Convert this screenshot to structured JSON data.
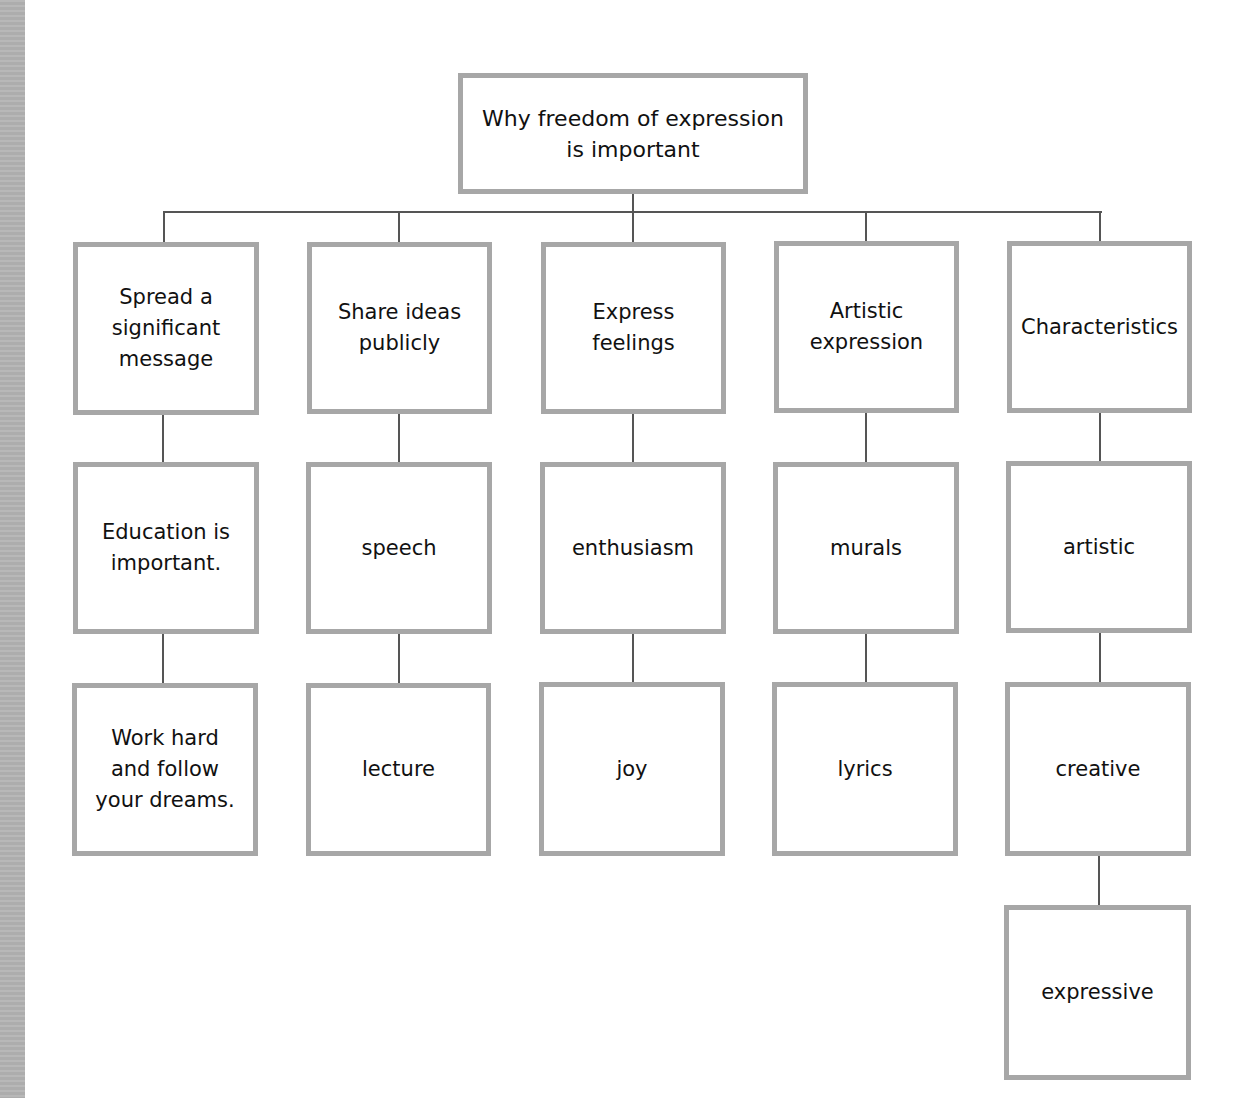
{
  "diagram": {
    "type": "hierarchy-tree",
    "root": {
      "label": "Why freedom of expression\nis important"
    },
    "branches": [
      {
        "label": "Spread a\nsignificant\nmessage",
        "children": [
          {
            "label": "Education is\nimportant."
          },
          {
            "label": "Work hard\nand follow\nyour dreams."
          }
        ]
      },
      {
        "label": "Share ideas\npublicly",
        "children": [
          {
            "label": "speech"
          },
          {
            "label": "lecture"
          }
        ]
      },
      {
        "label": "Express\nfeelings",
        "children": [
          {
            "label": "enthusiasm"
          },
          {
            "label": "joy"
          }
        ]
      },
      {
        "label": "Artistic\nexpression",
        "children": [
          {
            "label": "murals"
          },
          {
            "label": "lyrics"
          }
        ]
      },
      {
        "label": "Characteristics",
        "children": [
          {
            "label": "artistic"
          },
          {
            "label": "creative"
          },
          {
            "label": "expressive"
          }
        ]
      }
    ]
  },
  "colors": {
    "box_border": "#a7a7a7",
    "connector": "#555555",
    "text": "#111111",
    "left_strip": "#b4b4b4",
    "background": "#ffffff"
  }
}
